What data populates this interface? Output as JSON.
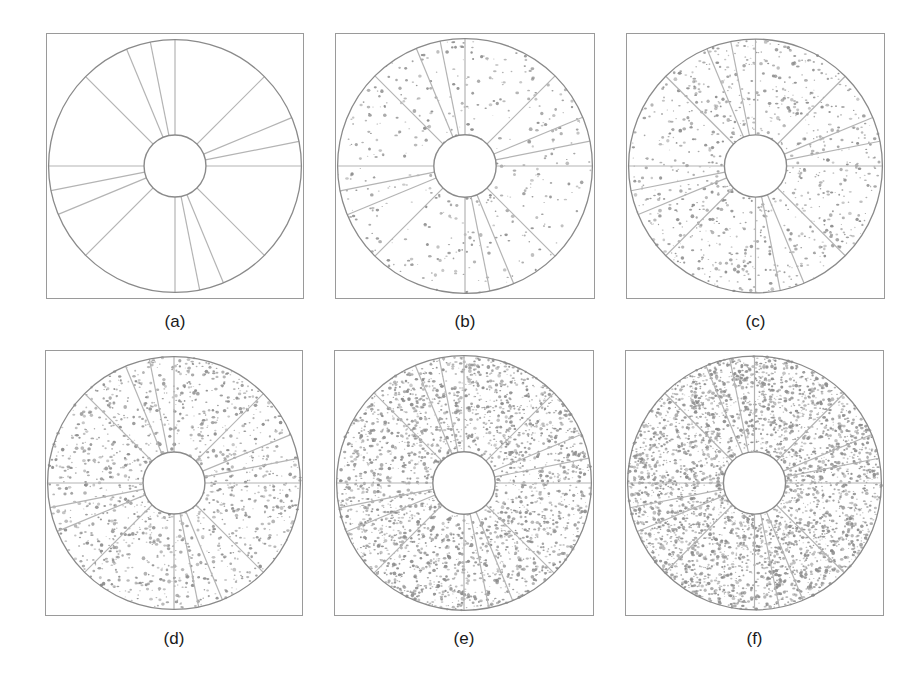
{
  "figure": {
    "geometry": {
      "spoke_angles_deg": [
        0,
        11.25,
        22.5,
        45,
        90,
        101.25,
        112.5,
        135,
        180,
        191.25,
        202.5,
        225,
        270,
        281.25,
        292.5,
        315
      ],
      "outer_radius_ratio": 0.49,
      "inner_radius_ratio": 0.12
    },
    "colors": {
      "frame": "#9a9a9a",
      "circle": "#8a8a8a",
      "spoke": "#b4b4b4",
      "speckle": "#8c8c8c",
      "background": "#ffffff"
    },
    "panels": [
      {
        "id": "a",
        "label": "(a)",
        "x": 46,
        "y": 33,
        "w": 258,
        "h": 266,
        "speckle_count": 0
      },
      {
        "id": "b",
        "label": "(b)",
        "x": 335,
        "y": 33,
        "w": 260,
        "h": 266,
        "speckle_count": 420
      },
      {
        "id": "c",
        "label": "(c)",
        "x": 626,
        "y": 33,
        "w": 259,
        "h": 266,
        "speckle_count": 900
      },
      {
        "id": "d",
        "label": "(d)",
        "x": 45,
        "y": 350,
        "w": 258,
        "h": 266,
        "speckle_count": 1300
      },
      {
        "id": "e",
        "label": "(e)",
        "x": 334,
        "y": 350,
        "w": 260,
        "h": 266,
        "speckle_count": 2400
      },
      {
        "id": "f",
        "label": "(f)",
        "x": 625,
        "y": 350,
        "w": 259,
        "h": 266,
        "speckle_count": 3300
      }
    ]
  }
}
